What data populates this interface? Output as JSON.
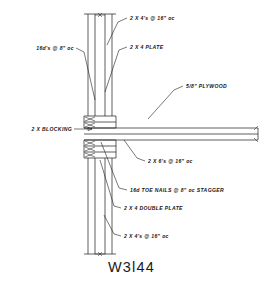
{
  "drawing": {
    "title": "W3l44",
    "type": "architectural-section-detail",
    "subject": "Wood wall framing to floor platform connection detail",
    "annotations": [
      {
        "id": "top-studs",
        "text": "2 X 4's @ 16\" oc",
        "align": "start",
        "x": 130,
        "y": 20,
        "leader": "M127,18 L118,22 L107,45"
      },
      {
        "id": "top-plate",
        "text": "2 X 4 PLATE",
        "align": "start",
        "x": 130,
        "y": 49,
        "leader": "M127,47 L119,50 L105,92"
      },
      {
        "id": "nails-16d",
        "text": "16d's @ 8\" oc",
        "align": "end",
        "x": 74,
        "y": 50,
        "leader": "M76,48 L84,52 L95,100"
      },
      {
        "id": "plywood",
        "text": "5/8\" PLYWOOD",
        "align": "start",
        "x": 186,
        "y": 88,
        "leader": "M183,86 L174,90 L148,119"
      },
      {
        "id": "blocking",
        "text": "2 X BLOCKING",
        "align": "end",
        "x": 72,
        "y": 131,
        "leader": "M74,129 L92,129"
      },
      {
        "id": "floor-joists",
        "text": "2 X 6's @ 16\" oc",
        "align": "start",
        "x": 148,
        "y": 163,
        "leader": "M145,161 L137,158 L124,140"
      },
      {
        "id": "toe-nails",
        "text": "16d TOE NAILS @ 8\" oc STAGGER",
        "align": "start",
        "x": 130,
        "y": 192,
        "leader": "M127,190 L119,188 L101,142"
      },
      {
        "id": "double-plate",
        "text": "2 X 4 DOUBLE PLATE",
        "align": "start",
        "x": 124,
        "y": 210,
        "leader": "M121,208 L114,206 L100,160"
      },
      {
        "id": "bottom-studs",
        "text": "2 X 4's @ 16\" oc",
        "align": "start",
        "x": 124,
        "y": 238,
        "leader": "M121,236 L114,234 L104,215"
      }
    ]
  }
}
